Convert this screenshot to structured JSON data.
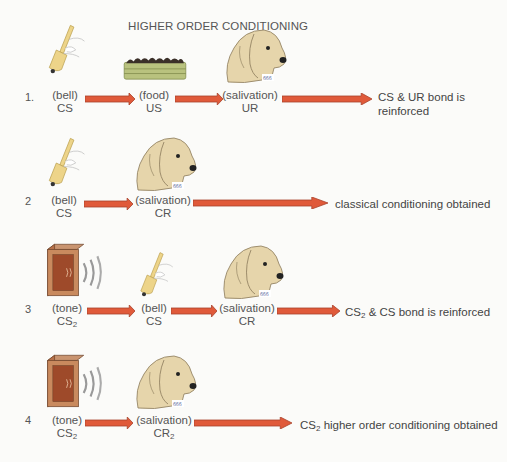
{
  "title": "HIGHER ORDER CONDITIONING",
  "colors": {
    "arrow": "#e05a3a",
    "arrow_outline": "#a8432c",
    "text": "#555555",
    "dog_fur": "#e6d5ab",
    "bell": "#edd489",
    "box": "#b7714a",
    "food_tray": "#b9c27e"
  },
  "rows": [
    {
      "number": "1.",
      "steps": [
        {
          "top": "(bell)",
          "bottom": "CS",
          "icon": "bell-icon"
        },
        {
          "top": "(food)",
          "bottom": "US",
          "icon": "food-tray-icon"
        },
        {
          "top": "(salivation)",
          "bottom": "UR",
          "icon": "dog-icon"
        }
      ],
      "outcome_line1": "CS & UR bond is",
      "outcome_line2": "reinforced"
    },
    {
      "number": "2",
      "steps": [
        {
          "top": "(bell)",
          "bottom": "CS",
          "icon": "bell-icon"
        },
        {
          "top": "(salivation)",
          "bottom": "CR",
          "icon": "dog-icon"
        }
      ],
      "outcome": "classical conditioning obtained"
    },
    {
      "number": "3",
      "steps": [
        {
          "top": "(tone)",
          "bottom": "CS",
          "bottom_sub": "2",
          "icon": "speaker-box-icon"
        },
        {
          "top": "(bell)",
          "bottom": "CS",
          "icon": "bell-icon"
        },
        {
          "top": "(salivation)",
          "bottom": "CR",
          "icon": "dog-icon"
        }
      ],
      "outcome_pre": "CS",
      "outcome_sub": "2",
      "outcome_post": " & CS bond is reinforced"
    },
    {
      "number": "4",
      "steps": [
        {
          "top": "(tone)",
          "bottom": "CS",
          "bottom_sub": "2",
          "icon": "speaker-box-icon"
        },
        {
          "top": "(salivation)",
          "bottom": "CR",
          "bottom_sub": "2",
          "icon": "dog-icon"
        }
      ],
      "outcome_pre": "CS",
      "outcome_sub": "2",
      "outcome_post": " higher order conditioning obtained"
    }
  ]
}
